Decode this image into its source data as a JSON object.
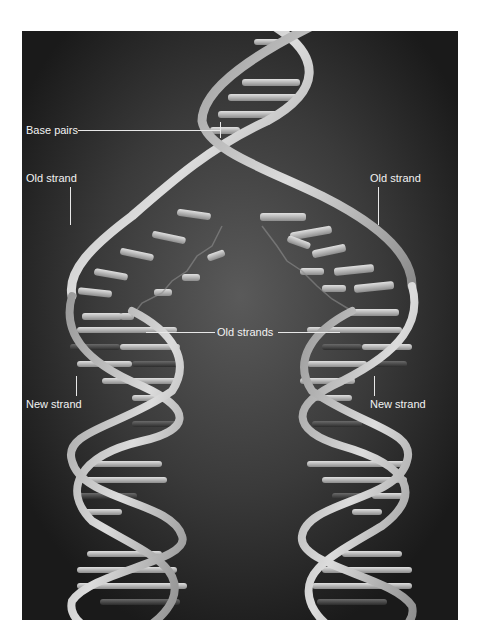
{
  "figure": {
    "background_color": "#1c1c1c",
    "label_color": "#f2f2f2",
    "labels": {
      "base_pairs": "Base pairs",
      "old_strand_left": "Old strand",
      "old_strand_right": "Old strand",
      "old_strands": "Old strands",
      "new_strand_left": "New strand",
      "new_strand_right": "New strand"
    }
  }
}
